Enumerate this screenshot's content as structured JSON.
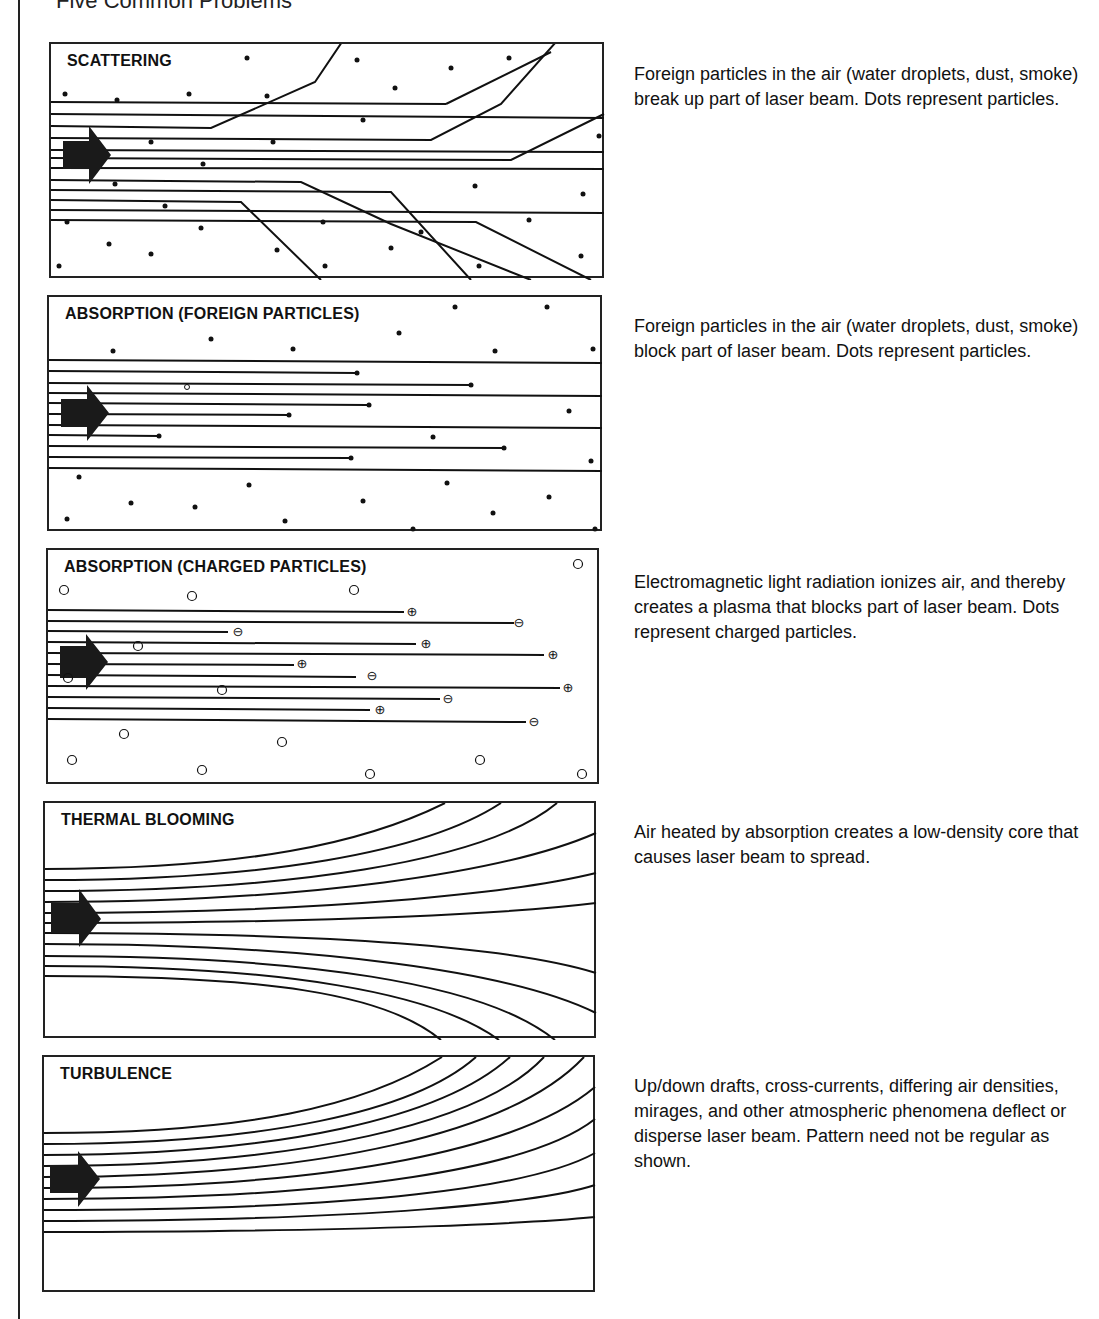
{
  "page": {
    "heading": "Five Common Problems"
  },
  "panels": [
    {
      "title": "SCATTERING",
      "description": "Foreign particles in the air (water droplets, dust, smoke) break up part of laser beam. Dots represent particles.",
      "icon": "laser-beam-arrow"
    },
    {
      "title": "ABSORPTION (FOREIGN PARTICLES)",
      "description": "Foreign particles in the air (water droplets, dust, smoke) block part of laser beam. Dots represent particles.",
      "icon": "laser-beam-arrow"
    },
    {
      "title": "ABSORPTION (CHARGED PARTICLES)",
      "description": "Electromagnetic light radiation ionizes air, and thereby creates a plasma that blocks part of laser beam. Dots represent charged particles.",
      "icon": "laser-beam-arrow",
      "particle_symbols": {
        "positive": "⊕",
        "negative": "⊖",
        "neutral": "○"
      }
    },
    {
      "title": "THERMAL BLOOMING",
      "description": "Air heated by absorption creates a low-density core that causes laser beam to spread.",
      "icon": "laser-beam-arrow"
    },
    {
      "title": "TURBULENCE",
      "description": "Up/down drafts, cross-currents, differing air densities, mirages, and other atmospheric phenomena deflect or disperse laser beam. Pattern need not be regular as shown.",
      "icon": "laser-beam-arrow"
    }
  ],
  "colors": {
    "ink": "#111111",
    "paper": "#ffffff"
  }
}
